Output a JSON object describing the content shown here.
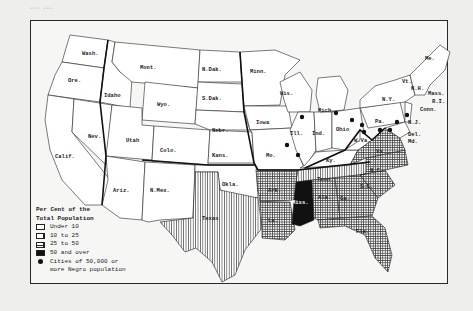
{
  "map": {
    "legend": {
      "title_line1": "Per Cent of the",
      "title_line2": "Total Population",
      "items": [
        {
          "label": "Under 10",
          "pattern": "blank"
        },
        {
          "label": "10 to 25",
          "pattern": "vertical-lines"
        },
        {
          "label": "25 to 50",
          "pattern": "crosshatch"
        },
        {
          "label": "50 and over",
          "pattern": "solid-black"
        }
      ],
      "cities_line1": "Cities of 50,000 or",
      "cities_line2": "more Negro population"
    },
    "states": {
      "wash": "Wash.",
      "ore": "Ore.",
      "calif": "Calif.",
      "nev": "Nev.",
      "idaho": "Idaho",
      "mont": "Mont.",
      "wyo": "Wyo.",
      "utah": "Utah",
      "colo": "Colo.",
      "ariz": "Ariz.",
      "nmex": "N.Mex.",
      "ndak": "N.Dak.",
      "sdak": "S.Dak.",
      "nebr": "Nebr.",
      "kans": "Kans.",
      "okla": "Okla.",
      "texas": "Texas",
      "minn": "Minn.",
      "iowa": "Iowa",
      "mo": "Mo.",
      "ark": "Ark.",
      "la": "La.",
      "wis": "Wis.",
      "ill": "Ill.",
      "ind": "Ind.",
      "mich": "Mich.",
      "ohio": "Ohio",
      "ky": "Ky.",
      "tenn": "Tenn.",
      "miss": "Miss.",
      "ala": "Ala.",
      "ga": "Ga.",
      "fla": "Fla.",
      "sc": "S.C.",
      "nc": "N.C.",
      "va": "Va.",
      "wva": "W.Va.",
      "pa": "Pa.",
      "ny": "N.Y.",
      "nj": "N.J.",
      "del": "Del.",
      "md": "Md.",
      "conn": "Conn.",
      "ri": "R.I.",
      "mass": "Mass.",
      "vt": "Vt.",
      "nh": "N.H.",
      "me": "Me."
    },
    "colors": {
      "ink": "#222222",
      "paper": "#f6f6f4",
      "page": "#eeeeec"
    }
  }
}
